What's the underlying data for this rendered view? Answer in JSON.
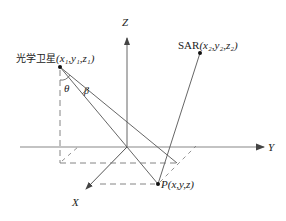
{
  "diagram": {
    "axes": {
      "z_label": "Z",
      "y_label": "Y",
      "x_label": "X"
    },
    "points": {
      "optical": {
        "name": "光学卫星",
        "coords": "(x₁,y₁,z₁)"
      },
      "sar": {
        "name": "SAR",
        "coords": "(x₂,y₂,z₂)"
      },
      "target": {
        "name": "P",
        "coords": "(x,y,z)"
      }
    },
    "angles": {
      "theta": "θ",
      "beta": "β"
    },
    "colors": {
      "line": "#555555",
      "dash": "#777777",
      "point": "#111111"
    }
  }
}
